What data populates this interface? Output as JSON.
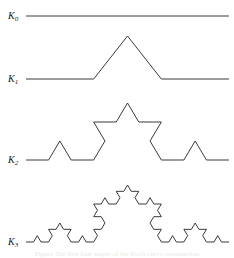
{
  "figure": {
    "background_color": "#ffffff",
    "stroke_color": "#242424",
    "label_color": "#1a1a1a",
    "width": 234,
    "height": 258
  },
  "labels": [
    {
      "name": "K0",
      "base": "K",
      "subscript": "0",
      "x": 8,
      "y": 11
    },
    {
      "name": "K1",
      "base": "K",
      "subscript": "1",
      "x": 8,
      "y": 74
    },
    {
      "name": "K2",
      "base": "K",
      "subscript": "2",
      "x": 8,
      "y": 155
    },
    {
      "name": "K3",
      "base": "K",
      "subscript": "3",
      "x": 8,
      "y": 237
    }
  ],
  "caption": {
    "text": "Figure  The first four stages of the Koch curve construction"
  },
  "chart_data": {
    "type": "line",
    "xlabel": "",
    "ylabel": "",
    "grid": false,
    "legend": "none",
    "xlim": [
      26,
      229
    ],
    "ylim": [
      0,
      258
    ],
    "series": [
      {
        "name": "K0",
        "iteration": 0,
        "segments": 1,
        "x_start": 26,
        "x_end": 229,
        "baseline_y": 16,
        "bump_height": 0,
        "peak_y": 16
      },
      {
        "name": "K1",
        "iteration": 1,
        "segments": 4,
        "x_start": 26,
        "x_end": 229,
        "baseline_y": 79,
        "bump_height": 43,
        "peak_y": 36
      },
      {
        "name": "K2",
        "iteration": 2,
        "segments": 16,
        "x_start": 26,
        "x_end": 229,
        "baseline_y": 160,
        "bump_height": 57,
        "peak_y": 103
      },
      {
        "name": "K3",
        "iteration": 3,
        "segments": 64,
        "x_start": 26,
        "x_end": 229,
        "baseline_y": 242,
        "bump_height": 57,
        "peak_y": 185
      }
    ]
  }
}
